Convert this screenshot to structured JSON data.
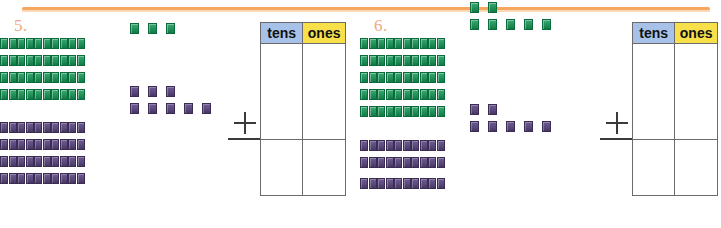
{
  "page": {
    "accent_rule_color": "#f5a75e",
    "background": "#ffffff"
  },
  "problems": [
    {
      "number_label": "5.",
      "number_color": "#efa882",
      "addend_1": {
        "color_name": "green",
        "color_hex": "#229158",
        "tens": 4,
        "ones": 3,
        "value": 43,
        "ones_rows": [
          3
        ]
      },
      "addend_2": {
        "color_name": "purple",
        "color_hex": "#5b4a7e",
        "tens": 4,
        "ones": 8,
        "value": 48,
        "ones_rows": [
          3,
          5
        ]
      },
      "operator": "+",
      "place_value_table": {
        "headers": [
          "tens",
          "ones"
        ],
        "header_colors": [
          "#a7c1e8",
          "#f7e04a"
        ],
        "addends_cells": [
          "",
          ""
        ],
        "sum_cells": [
          "",
          ""
        ]
      }
    },
    {
      "number_label": "6.",
      "number_color": "#efa882",
      "addend_1": {
        "color_name": "green",
        "color_hex": "#229158",
        "tens": 5,
        "ones": 7,
        "value": 57,
        "ones_rows": [
          2,
          5
        ]
      },
      "addend_2": {
        "color_name": "purple",
        "color_hex": "#5b4a7e",
        "tens": 3,
        "ones": 7,
        "value": 37,
        "ones_rows": [
          2,
          5
        ]
      },
      "operator": "+",
      "place_value_table": {
        "headers": [
          "tens",
          "ones"
        ],
        "header_colors": [
          "#a7c1e8",
          "#f7e04a"
        ],
        "addends_cells": [
          "",
          ""
        ],
        "sum_cells": [
          "",
          ""
        ]
      }
    }
  ]
}
